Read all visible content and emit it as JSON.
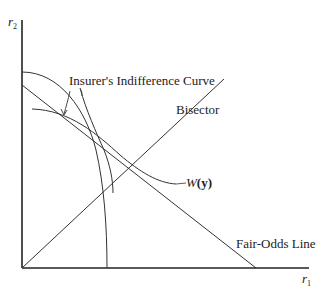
{
  "axes": {
    "y_label": "r",
    "y_sub": "2",
    "x_label": "r",
    "x_sub": "1"
  },
  "labels": {
    "insurer_curve": "Insurer's Indifference Curve",
    "bisector": "Bisector",
    "w_prefix": "W",
    "w_arg": "(y)",
    "fair_odds": "Fair-Odds Line"
  },
  "colors": {
    "line": "#333333",
    "axis": "#222222",
    "background": "#ffffff"
  }
}
